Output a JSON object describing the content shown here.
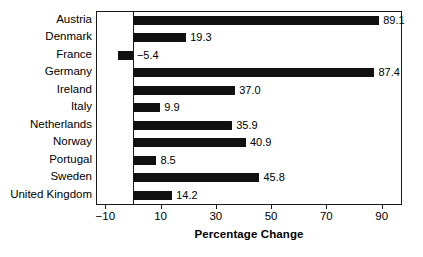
{
  "chart_data": {
    "type": "bar",
    "orientation": "horizontal",
    "title": "",
    "xlabel": "Percentage Change",
    "ylabel": "",
    "categories": [
      "Austria",
      "Denmark",
      "France",
      "Germany",
      "Ireland",
      "Italy",
      "Netherlands",
      "Norway",
      "Portugal",
      "Sweden",
      "United Kingdom"
    ],
    "values": [
      89.1,
      19.3,
      -5.4,
      87.4,
      37.0,
      9.9,
      35.9,
      40.9,
      8.5,
      45.8,
      14.2
    ],
    "value_labels": [
      "89.1",
      "19.3",
      "−5.4",
      "87.4",
      "37.0",
      "9.9",
      "35.9",
      "40.9",
      "8.5",
      "45.8",
      "14.2"
    ],
    "xlim": [
      -13,
      97
    ],
    "xticks": [
      -10,
      10,
      30,
      50,
      70,
      90
    ],
    "xtick_labels": [
      "−10",
      "10",
      "30",
      "50",
      "70",
      "90"
    ],
    "grid": false,
    "legend": null,
    "bar_color": "#111111",
    "axis_color": "#1a1a1a",
    "background_color": "#ffffff",
    "zero_line": 0
  }
}
